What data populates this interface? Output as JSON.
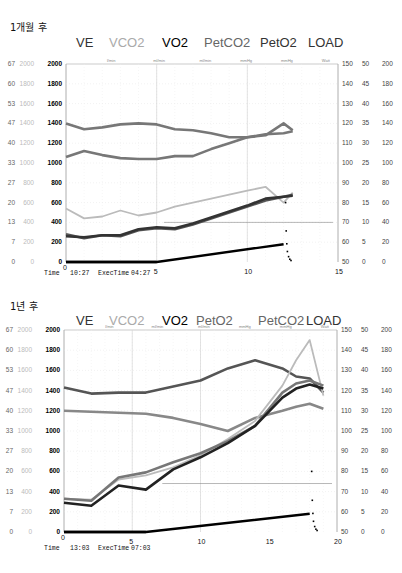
{
  "chart_data": [
    {
      "type": "line",
      "title": "1개월 후",
      "legend": [
        "VE",
        "VCO2",
        "VO2",
        "PETCO2",
        "PETO2",
        "LOAD"
      ],
      "legend_labels": [
        "VE",
        "VCO2",
        "VO2",
        "PetCO2",
        "PetO2",
        "LOAD"
      ],
      "units": [
        "l/min",
        "ml/min",
        "ml/min",
        "mmHg",
        "mmHg",
        "Watt"
      ],
      "left_axes": {
        "ve": [
          "67",
          "60",
          "53",
          "47",
          "40",
          "33",
          "27",
          "20",
          "13",
          "7",
          "0"
        ],
        "vco2": [
          "2000",
          "1800",
          "1600",
          "1400",
          "1200",
          "1000",
          "800",
          "600",
          "400",
          "200",
          "0"
        ],
        "vo2": [
          "2000",
          "1800",
          "1600",
          "1400",
          "1200",
          "1000",
          "800",
          "600",
          "400",
          "200",
          "0"
        ]
      },
      "right_axes": {
        "hr": [
          "150",
          "140",
          "130",
          "120",
          "110",
          "100",
          "90",
          "80",
          "70",
          "60",
          "50"
        ],
        "peco2": [
          "50",
          "45",
          "40",
          "35",
          "30",
          "25",
          "20",
          "15",
          "10",
          "5",
          "0"
        ],
        "load": [
          "200",
          "180",
          "160",
          "140",
          "120",
          "100",
          "80",
          "60",
          "40",
          "20",
          "0"
        ]
      },
      "x_ticks": [
        "0",
        "5",
        "10",
        "15"
      ],
      "xlim": [
        0,
        15
      ],
      "footer": {
        "time_label": "Time",
        "time": "10:27",
        "exec_label": "ExecTime",
        "exec": "04:27"
      },
      "series": [
        {
          "name": "PetO2",
          "color": "#777",
          "x": [
            0,
            1,
            2,
            3,
            4,
            5,
            6,
            7,
            8,
            9,
            10,
            11,
            12,
            12.5
          ],
          "values": [
            1400,
            1340,
            1360,
            1390,
            1400,
            1390,
            1340,
            1330,
            1300,
            1260,
            1260,
            1280,
            1400,
            1330
          ]
        },
        {
          "name": "PetCO2",
          "color": "#777",
          "x": [
            0,
            1,
            2,
            3,
            4,
            5,
            6,
            7,
            8,
            9,
            10,
            11,
            12,
            12.5
          ],
          "values": [
            1060,
            1120,
            1080,
            1050,
            1040,
            1040,
            1070,
            1070,
            1140,
            1200,
            1260,
            1290,
            1300,
            1320
          ]
        },
        {
          "name": "VE",
          "color": "#bbb",
          "x": [
            0,
            1,
            2,
            3,
            4,
            5,
            6,
            7,
            8,
            9,
            10,
            11,
            12,
            12.5
          ],
          "values": [
            540,
            440,
            460,
            520,
            470,
            500,
            560,
            600,
            640,
            680,
            720,
            760,
            600,
            700
          ]
        },
        {
          "name": "VCO2",
          "color": "#555",
          "x": [
            0,
            1,
            2,
            3,
            4,
            5,
            6,
            7,
            8,
            9,
            10,
            11,
            12,
            12.5
          ],
          "values": [
            280,
            240,
            270,
            260,
            320,
            340,
            330,
            380,
            440,
            500,
            560,
            620,
            660,
            680
          ]
        },
        {
          "name": "VO2",
          "color": "#333",
          "x": [
            0,
            1,
            2,
            3,
            4,
            5,
            6,
            7,
            8,
            9,
            10,
            11,
            12,
            12.5
          ],
          "values": [
            260,
            250,
            270,
            270,
            330,
            350,
            340,
            390,
            450,
            510,
            570,
            640,
            660,
            670
          ]
        },
        {
          "name": "LOAD",
          "color": "#000",
          "x": [
            0,
            5,
            12
          ],
          "values": [
            0,
            0,
            180
          ]
        }
      ]
    },
    {
      "type": "line",
      "title": "1년 후",
      "legend": [
        "VE",
        "VCO2",
        "VO2",
        "PETO2",
        "PETCO2",
        "LOAD"
      ],
      "legend_labels": [
        "VE",
        "VCO2",
        "VO2",
        "PetO2",
        "PetCO2",
        "LOAD"
      ],
      "units": [
        "l/min",
        "ml/min",
        "ml/min",
        "mmHg",
        "mmHg",
        "Watt"
      ],
      "left_axes": {
        "ve": [
          "67",
          "60",
          "53",
          "47",
          "40",
          "33",
          "27",
          "20",
          "13",
          "7",
          "0"
        ],
        "vco2": [
          "2000",
          "1800",
          "1600",
          "1400",
          "1200",
          "1000",
          "800",
          "600",
          "400",
          "200",
          "0"
        ],
        "vo2": [
          "2000",
          "1800",
          "1600",
          "1400",
          "1200",
          "1000",
          "800",
          "600",
          "400",
          "200",
          "0"
        ]
      },
      "right_axes": {
        "hr": [
          "150",
          "140",
          "130",
          "120",
          "110",
          "100",
          "90",
          "80",
          "70",
          "60",
          "50"
        ],
        "peco2": [
          "50",
          "45",
          "40",
          "35",
          "30",
          "25",
          "20",
          "15",
          "10",
          "5",
          "0"
        ],
        "load": [
          "200",
          "180",
          "160",
          "140",
          "120",
          "100",
          "80",
          "60",
          "40",
          "20",
          "0"
        ]
      },
      "x_ticks": [
        "0",
        "5",
        "10",
        "15",
        "20"
      ],
      "xlim": [
        0,
        20
      ],
      "footer": {
        "time_label": "Time",
        "time": "13:03",
        "exec_label": "ExecTime",
        "exec": "07:03"
      },
      "series": [
        {
          "name": "PetO2",
          "color": "#555",
          "x": [
            0,
            2,
            4,
            6,
            8,
            10,
            12,
            14,
            16,
            17,
            18,
            19
          ],
          "values": [
            1430,
            1370,
            1380,
            1380,
            1440,
            1500,
            1620,
            1700,
            1620,
            1540,
            1520,
            1380
          ]
        },
        {
          "name": "PetCO2",
          "color": "#888",
          "x": [
            0,
            2,
            4,
            6,
            8,
            10,
            12,
            14,
            16,
            17,
            18,
            19
          ],
          "values": [
            1200,
            1190,
            1180,
            1170,
            1130,
            1070,
            1000,
            1130,
            1200,
            1240,
            1270,
            1220
          ]
        },
        {
          "name": "VE",
          "color": "#bbb",
          "x": [
            0,
            2,
            4,
            6,
            8,
            10,
            12,
            14,
            16,
            17,
            18,
            19
          ],
          "values": [
            330,
            320,
            520,
            560,
            640,
            760,
            920,
            1100,
            1450,
            1700,
            1900,
            1350
          ]
        },
        {
          "name": "VCO2",
          "color": "#777",
          "x": [
            0,
            2,
            4,
            6,
            8,
            10,
            12,
            14,
            16,
            17,
            18,
            19
          ],
          "values": [
            330,
            310,
            540,
            590,
            690,
            780,
            900,
            1050,
            1380,
            1470,
            1500,
            1450
          ]
        },
        {
          "name": "VO2",
          "color": "#222",
          "x": [
            0,
            2,
            4,
            6,
            8,
            10,
            12,
            14,
            16,
            17,
            18,
            19
          ],
          "values": [
            290,
            260,
            460,
            420,
            620,
            740,
            880,
            1050,
            1330,
            1420,
            1460,
            1420
          ]
        },
        {
          "name": "LOAD",
          "color": "#000",
          "x": [
            0,
            6,
            18
          ],
          "values": [
            0,
            0,
            180
          ]
        }
      ]
    }
  ],
  "sections": [
    {
      "title": "1개월 후"
    },
    {
      "title": "1년 후"
    }
  ]
}
